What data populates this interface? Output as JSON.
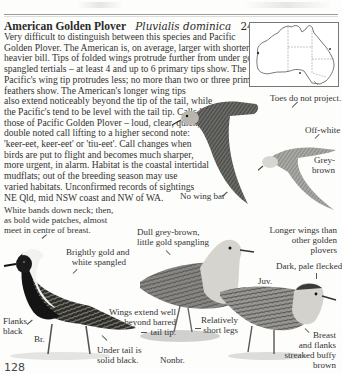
{
  "header": {
    "common_name": "American Golden Plover",
    "scientific_name": "Pluvialis dominica",
    "size": "24–28 cm"
  },
  "description_lines": [
    "Very difficult to distinguish between this species and Pacific",
    "Golden Plover. The American is, on average, larger with shorter legs,",
    "heavier bill. Tips of folded wings protrude further from under gold-",
    "spangled tertials – at least 4 and up to 6 primary tips show. The",
    "Pacific's wing tip protrudes less; no more than two or three primary",
    "feathers show. The American's longer wing tips",
    "also extend noticeably beyond the tip of the tail, while",
    "the Pacific's tend to be level with the tail tip. Calls like",
    "those of Pacific Golden Plover – loud, clear, quick,",
    "double noted call lifting to a higher second note:",
    "'keer-eet, keer-eet' or 'tiu-eet'. Call changes when",
    "birds are put to flight and becomes much sharper,",
    "more urgent, in alarm. Habitat is the coastal intertidal",
    "mudflats; out of the breeding season may use",
    "varied habitats. Unconfirmed records of sightings",
    "NE Qld, mid NSW coast and NW of WA."
  ],
  "map": {
    "label": "distribution-map-australia"
  },
  "annotations": {
    "toes": "Toes do not project.",
    "off_white": "Off-white",
    "grey_brown": [
      "Grey-",
      "brown"
    ],
    "no_wing_bar": "No wing bar",
    "longer_wings": [
      "Longer wings than",
      "other golden",
      "plovers"
    ],
    "white_bands": [
      "White bands down neck; then,",
      "as bold wide patches, almost",
      "meet in centre of breast."
    ],
    "dull_grey": [
      "Dull grey-brown,",
      "little gold spangling"
    ],
    "brightly_gold": [
      "Brightly gold and",
      "white spangled"
    ],
    "dark_pale": "Dark, pale flecked",
    "juv": "Juv.",
    "flanks_black": [
      "Flanks",
      "black"
    ],
    "br": "Br.",
    "wings_extend": [
      "Wings extend well",
      "beyond barred",
      "tail tip."
    ],
    "relatively_short": [
      "Relatively",
      "short legs"
    ],
    "breast_flanks": [
      "Breast",
      "and flanks",
      "streaked buffy",
      "brown"
    ],
    "under_tail": [
      "Under tail is",
      "solid black."
    ],
    "nonbr": "Nonbr."
  },
  "page_number": "128"
}
